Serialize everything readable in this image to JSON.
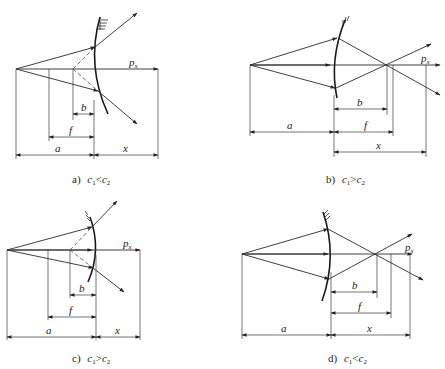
{
  "figure": {
    "title_strip": "",
    "labels": {
      "axis_symbol": "p",
      "axis_subscript": "x",
      "dim_a": "a",
      "dim_b": "b",
      "dim_f": "f",
      "dim_x": "x"
    },
    "panels": [
      {
        "id": "a",
        "caption_letter": "a)",
        "caption_left": "c",
        "caption_left_sub": "1",
        "caption_op": "<",
        "caption_right": "c",
        "caption_right_sub": "2",
        "mirror_type": "convex-diverging",
        "focus_side": "virtual"
      },
      {
        "id": "b",
        "caption_letter": "b)",
        "caption_left": "c",
        "caption_left_sub": "1",
        "caption_op": ">",
        "caption_right": "c",
        "caption_right_sub": "2",
        "mirror_type": "converging",
        "focus_side": "real"
      },
      {
        "id": "c",
        "caption_letter": "c)",
        "caption_left": "c",
        "caption_left_sub": "1",
        "caption_op": ">",
        "caption_right": "c",
        "caption_right_sub": "2",
        "mirror_type": "concave-diverging",
        "focus_side": "virtual"
      },
      {
        "id": "d",
        "caption_letter": "d)",
        "caption_left": "c",
        "caption_left_sub": "1",
        "caption_op": "<",
        "caption_right": "c",
        "caption_right_sub": "2",
        "mirror_type": "converging",
        "focus_side": "real"
      }
    ]
  }
}
